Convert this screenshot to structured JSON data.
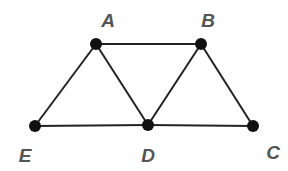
{
  "diagram": {
    "type": "graph",
    "nodes": [
      {
        "id": "A",
        "label": "A",
        "x": 96,
        "y": 44,
        "lx": 108,
        "ly": 27
      },
      {
        "id": "B",
        "label": "B",
        "x": 201,
        "y": 44,
        "lx": 208,
        "ly": 27
      },
      {
        "id": "E",
        "label": "E",
        "x": 35,
        "y": 126,
        "lx": 25,
        "ly": 162
      },
      {
        "id": "D",
        "label": "D",
        "x": 148,
        "y": 125,
        "lx": 148,
        "ly": 162
      },
      {
        "id": "C",
        "label": "C",
        "x": 253,
        "y": 126,
        "lx": 273,
        "ly": 159
      }
    ],
    "edges": [
      [
        "A",
        "B"
      ],
      [
        "A",
        "E"
      ],
      [
        "A",
        "D"
      ],
      [
        "B",
        "D"
      ],
      [
        "B",
        "C"
      ],
      [
        "E",
        "D"
      ],
      [
        "D",
        "C"
      ]
    ]
  }
}
